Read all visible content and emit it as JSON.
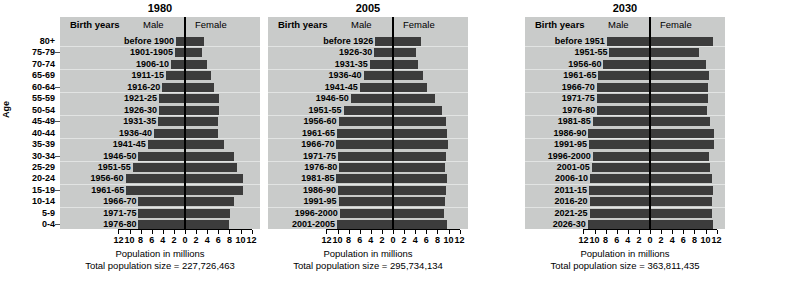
{
  "figure": {
    "age_axis_title": "Age",
    "age_labels": [
      "80+",
      "75-79",
      "70-74",
      "65-69",
      "60-64",
      "55-59",
      "50-54",
      "45-49",
      "40-44",
      "35-39",
      "30-34",
      "25-29",
      "20-24",
      "15-19",
      "10-14",
      "5-9",
      "0-4"
    ],
    "column_headers": {
      "birth_years": "Birth years",
      "male": "Male",
      "female": "Female"
    },
    "xlabel": "Population in millions",
    "total_prefix": "Total population size = ",
    "tick_labels": [
      "12",
      "10",
      "8",
      "6",
      "4",
      "2",
      "0",
      "2",
      "4",
      "6",
      "8",
      "10",
      "12"
    ],
    "colors": {
      "panel_background": "#c9cbca",
      "bar": "#3c3c3c",
      "gridline": "#e2e4e3",
      "axis": "#000000",
      "page_background": "#ffffff"
    }
  },
  "chart_data": [
    {
      "type": "bar",
      "title": "1980",
      "subtitle": "Total population size = 227,726,463",
      "total_population": "227,726,463",
      "total_population_value": 227726463,
      "xlabel": "Population in millions",
      "ylabel": "Age",
      "xlim": [
        -12,
        12
      ],
      "xticks": [
        12,
        10,
        8,
        6,
        4,
        2,
        0,
        2,
        4,
        6,
        8,
        10,
        12
      ],
      "grid": true,
      "legend_position": "top-inline",
      "categories": [
        "80+",
        "75-79",
        "70-74",
        "65-69",
        "60-64",
        "55-59",
        "50-54",
        "45-49",
        "40-44",
        "35-39",
        "30-34",
        "25-29",
        "20-24",
        "15-19",
        "10-14",
        "5-9",
        "0-4"
      ],
      "birth_years": [
        "before 1900",
        "1901-1905",
        "1906-10",
        "1911-15",
        "1916-20",
        "1921-25",
        "1926-30",
        "1931-35",
        "1936-40",
        "1941-45",
        "1946-50",
        "1951-55",
        "1956-60",
        "1961-65",
        "1966-70",
        "1971-75",
        "1976-80"
      ],
      "series": [
        {
          "name": "Male",
          "values": [
            1.6,
            1.8,
            2.5,
            3.4,
            4.1,
            4.7,
            4.7,
            4.8,
            5.6,
            6.7,
            8.4,
            9.4,
            10.7,
            10.6,
            8.4,
            8.4,
            8.4
          ]
        },
        {
          "name": "Female",
          "values": [
            3.4,
            3.0,
            3.9,
            4.7,
            5.3,
            6.1,
            6.1,
            6.0,
            6.0,
            7.0,
            8.8,
            9.3,
            10.5,
            10.5,
            8.8,
            8.1,
            8.0
          ]
        }
      ]
    },
    {
      "type": "bar",
      "title": "2005",
      "subtitle": "Total population size = 295,734,134",
      "total_population": "295,734,134",
      "total_population_value": 295734134,
      "xlabel": "Population in millions",
      "ylabel": "Age",
      "xlim": [
        -12,
        12
      ],
      "xticks": [
        12,
        10,
        8,
        6,
        4,
        2,
        0,
        2,
        4,
        6,
        8,
        10,
        12
      ],
      "grid": true,
      "legend_position": "top-inline",
      "categories": [
        "80+",
        "75-79",
        "70-74",
        "65-69",
        "60-64",
        "55-59",
        "50-54",
        "45-49",
        "40-44",
        "35-39",
        "30-34",
        "25-29",
        "20-24",
        "15-19",
        "10-14",
        "5-9",
        "0-4"
      ],
      "birth_years": [
        "before 1926",
        "1926-30",
        "1931-35",
        "1936-40",
        "1941-45",
        "1946-50",
        "1951-55",
        "1956-60",
        "1961-65",
        "1966-70",
        "1971-75",
        "1976-80",
        "1981-85",
        "1986-90",
        "1991-95",
        "1996-2000",
        "2001-2005"
      ],
      "series": [
        {
          "name": "Male",
          "values": [
            3.2,
            3.4,
            4.2,
            5.3,
            6.0,
            7.6,
            8.9,
            9.8,
            10.1,
            10.2,
            9.9,
            9.7,
            10.2,
            9.9,
            9.8,
            9.6,
            10.1
          ]
        },
        {
          "name": "Female",
          "values": [
            5.1,
            4.1,
            4.5,
            5.4,
            6.2,
            7.6,
            8.8,
            9.5,
            9.8,
            9.9,
            9.5,
            9.3,
            9.7,
            9.5,
            9.4,
            9.2,
            9.7
          ]
        }
      ]
    },
    {
      "type": "bar",
      "title": "2030",
      "subtitle": "Total population size = 363,811,435",
      "total_population": "363,811,435",
      "total_population_value": 363811435,
      "xlabel": "Population in millions",
      "ylabel": "Age",
      "xlim": [
        -12,
        12
      ],
      "xticks": [
        12,
        10,
        8,
        6,
        4,
        2,
        0,
        2,
        4,
        6,
        8,
        10,
        12
      ],
      "grid": true,
      "legend_position": "top-inline",
      "categories": [
        "80+",
        "75-79",
        "70-74",
        "65-69",
        "60-64",
        "55-59",
        "50-54",
        "45-49",
        "40-44",
        "35-39",
        "30-34",
        "25-29",
        "20-24",
        "15-19",
        "10-14",
        "5-9",
        "0-4"
      ],
      "birth_years": [
        "before 1951",
        "1951-55",
        "1956-60",
        "1961-65",
        "1966-70",
        "1971-75",
        "1976-80",
        "1981-85",
        "1986-90",
        "1991-95",
        "1996-2000",
        "2001-05",
        "2006-10",
        "2011-15",
        "2016-20",
        "2021-25",
        "2026-30"
      ],
      "series": [
        {
          "name": "Male",
          "values": [
            7.8,
            7.3,
            8.4,
            9.3,
            9.6,
            9.6,
            9.5,
            10.3,
            11.1,
            11.0,
            10.3,
            10.5,
            10.8,
            11.0,
            10.9,
            10.9,
            11.2
          ]
        },
        {
          "name": "Female",
          "values": [
            11.3,
            8.8,
            10.0,
            10.6,
            10.4,
            10.4,
            10.2,
            10.8,
            11.6,
            11.5,
            10.7,
            10.9,
            11.1,
            11.3,
            11.1,
            11.1,
            11.4
          ]
        }
      ]
    }
  ]
}
